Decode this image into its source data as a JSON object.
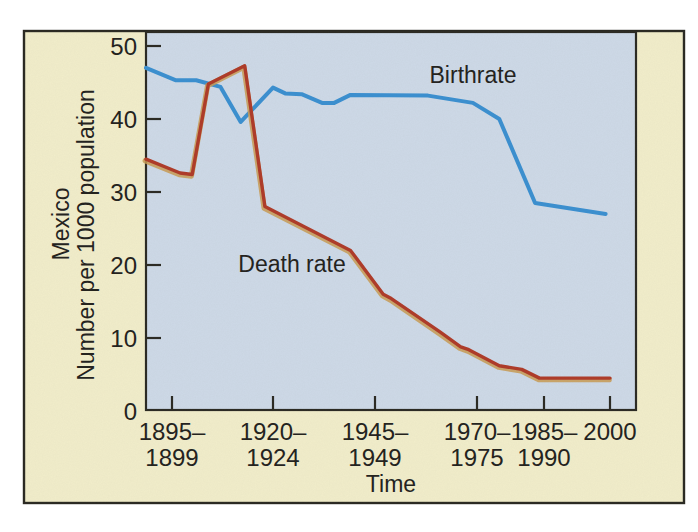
{
  "figure": {
    "y_axis_title_line1": "Mexico",
    "y_axis_title_line2": "Number per 1000 population",
    "x_axis_title": "Time",
    "birthrate_label": "Birthrate",
    "death_rate_label": "Death rate"
  },
  "chart_data": {
    "type": "line",
    "title": "",
    "xlabel": "Time",
    "ylabel": "Mexico — Number per 1000 population",
    "ylim": [
      0,
      52
    ],
    "grid": false,
    "legend_position": "inline-annotations",
    "y_ticks": [
      50,
      40,
      30,
      20,
      10,
      0
    ],
    "x_tick_labels": [
      [
        "1895–",
        "1899"
      ],
      [
        "1920–",
        "1924"
      ],
      [
        "1945–",
        "1949"
      ],
      [
        "1970–",
        "1975"
      ],
      [
        "1985–",
        "1990"
      ],
      [
        "2000"
      ]
    ],
    "series": [
      {
        "name": "Birthrate",
        "color": "#3a8fd0",
        "points": [
          [
            1890,
            47
          ],
          [
            1896,
            45.3
          ],
          [
            1901,
            45.3
          ],
          [
            1907,
            44.4
          ],
          [
            1912,
            39.6
          ],
          [
            1920,
            44.3
          ],
          [
            1923,
            43.5
          ],
          [
            1927,
            43.4
          ],
          [
            1932,
            42.2
          ],
          [
            1935,
            42.2
          ],
          [
            1939,
            43.3
          ],
          [
            1958,
            43.2
          ],
          [
            1969,
            42.2
          ],
          [
            1975,
            40
          ],
          [
            1983,
            28.5
          ],
          [
            1999,
            27
          ]
        ]
      },
      {
        "name": "Death rate",
        "color": "#ae3a28",
        "points": [
          [
            1890,
            34.5
          ],
          [
            1897,
            32.6
          ],
          [
            1900,
            32.4
          ],
          [
            1904,
            44.8
          ],
          [
            1913,
            47.3
          ],
          [
            1918,
            28
          ],
          [
            1939,
            22
          ],
          [
            1947,
            16
          ],
          [
            1949,
            15.4
          ],
          [
            1961,
            10.8
          ],
          [
            1966,
            8.8
          ],
          [
            1968,
            8.4
          ],
          [
            1975,
            6.2
          ],
          [
            1980,
            5.7
          ],
          [
            1984,
            4.5
          ],
          [
            2000,
            4.5
          ]
        ]
      }
    ],
    "layout": {
      "card_bg": "#f1edca",
      "plot_bg": "#cdd9e7",
      "border_color": "#2a2922",
      "death_rate_fringe_color": "#c89a52",
      "x_anchor_year_px": [
        [
          1890,
          146
        ],
        [
          1895,
          172
        ],
        [
          1920,
          273
        ],
        [
          1945,
          375
        ],
        [
          1970,
          477
        ],
        [
          1985,
          544
        ],
        [
          2000,
          610
        ]
      ],
      "x_tick_px": [
        172,
        273,
        375,
        477,
        544,
        610
      ],
      "y_value0_px": 411,
      "y_px_per_unit": 7.3,
      "tick_direction": "inward"
    }
  }
}
